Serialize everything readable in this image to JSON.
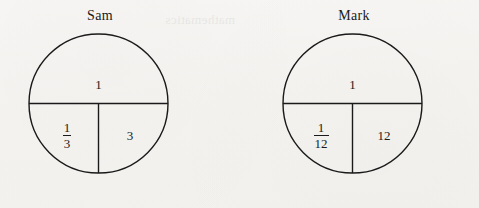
{
  "page": {
    "background_color": "#f5f4f2",
    "ink_color": "#1a1a1a",
    "bleed_through_text": "mathematics"
  },
  "diagrams": [
    {
      "name_label": "Sam",
      "top_value": "1",
      "bottom_left": {
        "numerator": "1",
        "denominator": "3"
      },
      "bottom_right_value": "3"
    },
    {
      "name_label": "Mark",
      "top_value": "1",
      "bottom_left": {
        "numerator": "1",
        "denominator": "12"
      },
      "bottom_right_value": "12"
    }
  ]
}
